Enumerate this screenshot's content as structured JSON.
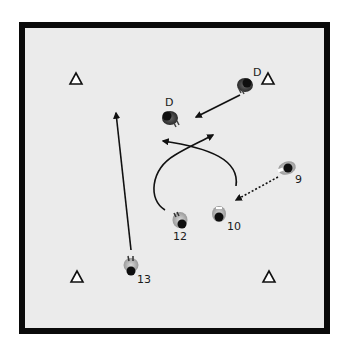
{
  "field": {
    "background": "#ebebeb",
    "border_color": "#0a0a0a"
  },
  "cones": [
    {
      "id": "cone-top-left",
      "x": 76,
      "y": 79
    },
    {
      "id": "cone-top-right",
      "x": 268,
      "y": 79
    },
    {
      "id": "cone-bottom-left",
      "x": 77,
      "y": 277
    },
    {
      "id": "cone-bottom-right",
      "x": 269,
      "y": 277
    }
  ],
  "players": [
    {
      "id": "defender-top-right",
      "role": "defender",
      "label": "D",
      "x": 245,
      "y": 85
    },
    {
      "id": "defender-center",
      "role": "defender",
      "label": "D",
      "x": 170,
      "y": 118
    },
    {
      "id": "attacker-9",
      "role": "attacker",
      "label": "9",
      "x": 287,
      "y": 168
    },
    {
      "id": "attacker-10",
      "role": "attacker",
      "label": "10",
      "x": 219,
      "y": 216
    },
    {
      "id": "attacker-12",
      "role": "attacker",
      "label": "12",
      "x": 180,
      "y": 222
    },
    {
      "id": "attacker-13",
      "role": "attacker",
      "label": "13",
      "x": 131,
      "y": 268
    }
  ],
  "movements": [
    {
      "id": "defender-run",
      "from": "defender-top-right",
      "type": "solid",
      "description": "D moves toward center"
    },
    {
      "id": "pass-9-to-10",
      "from": "attacker-9",
      "to": "attacker-10",
      "type": "dotted",
      "description": "Pass from 9 to 10"
    },
    {
      "id": "run-10-curve",
      "from": "attacker-10",
      "type": "solid-curve",
      "description": "10 curved run to upper left"
    },
    {
      "id": "run-12-curve",
      "from": "attacker-12",
      "type": "solid-curve",
      "description": "12 curved run to upper right"
    },
    {
      "id": "run-13-forward",
      "from": "attacker-13",
      "type": "solid",
      "description": "13 long run forward"
    }
  ]
}
